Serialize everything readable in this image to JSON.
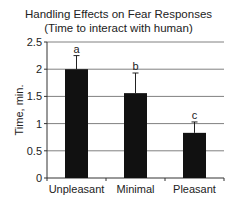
{
  "chart_data": {
    "type": "bar",
    "title": "Handling Effects on Fear Responses",
    "subtitle": "(Time to interact with human)",
    "xlabel": "",
    "ylabel": "Time, min.",
    "categories": [
      "Unpleasant",
      "Minimal",
      "Pleasant"
    ],
    "values": [
      2.0,
      1.56,
      0.83
    ],
    "error_upper": [
      0.25,
      0.37,
      0.2
    ],
    "significance_letters": [
      "a",
      "b",
      "c"
    ],
    "ylim": [
      0,
      2.5
    ],
    "yticks": [
      "0",
      "0.5",
      "1",
      "1.5",
      "2",
      "2.5"
    ],
    "grid": true,
    "legend": null,
    "bar_color": "#111111",
    "grid_color": "#808080"
  }
}
